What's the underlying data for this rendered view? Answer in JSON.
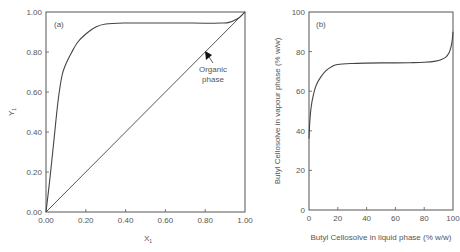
{
  "chart_data": [
    {
      "type": "line",
      "panel_label": "(a)",
      "title": "",
      "xlabel": "X",
      "xlabel_sub": "1",
      "ylabel": "Y",
      "ylabel_sub": "1",
      "xlim": [
        0,
        1
      ],
      "ylim": [
        0,
        1
      ],
      "xticks": [
        "0.00",
        "0.20",
        "0.40",
        "0.60",
        "0.80",
        "1.00"
      ],
      "yticks": [
        "0.00",
        "0.20",
        "0.40",
        "0.60",
        "0.80",
        "1.00"
      ],
      "grid": false,
      "series": [
        {
          "name": "equilibrium curve",
          "x": [
            0.0,
            0.02,
            0.04,
            0.06,
            0.08,
            0.1,
            0.13,
            0.16,
            0.2,
            0.25,
            0.3,
            0.4,
            0.5,
            0.6,
            0.7,
            0.8,
            0.88,
            0.92,
            0.96,
            0.98,
            1.0
          ],
          "y": [
            0.0,
            0.17,
            0.36,
            0.55,
            0.68,
            0.74,
            0.8,
            0.85,
            0.89,
            0.925,
            0.94,
            0.945,
            0.945,
            0.945,
            0.945,
            0.944,
            0.945,
            0.948,
            0.965,
            0.98,
            1.0
          ]
        },
        {
          "name": "diagonal y=x",
          "x": [
            0,
            1
          ],
          "y": [
            0,
            1
          ]
        }
      ],
      "annotations": [
        {
          "text_line1": "Organic",
          "text_line2": "phase",
          "arrow_to": [
            0.8,
            0.8
          ]
        }
      ]
    },
    {
      "type": "line",
      "panel_label": "(b)",
      "title": "",
      "xlabel": "Butyl Cellosolve in liquid phase (% w/w)",
      "ylabel": "Butyl Cellosolve in vapour phase (% w/w)",
      "xlim": [
        0,
        100
      ],
      "ylim": [
        0,
        100
      ],
      "xticks": [
        "0",
        "20",
        "40",
        "60",
        "80",
        "100"
      ],
      "yticks": [
        "0",
        "20",
        "40",
        "60",
        "80",
        "100"
      ],
      "grid": false,
      "series": [
        {
          "name": "vapour-liquid equilibrium",
          "x": [
            0,
            0.5,
            1.5,
            3,
            5,
            8,
            12,
            16,
            20,
            30,
            40,
            50,
            60,
            70,
            80,
            88,
            92,
            95,
            97,
            98.5,
            99.5,
            100
          ],
          "y": [
            36,
            44,
            52,
            58,
            63,
            67,
            70.5,
            72.5,
            73.5,
            74,
            74.2,
            74.3,
            74.3,
            74.4,
            74.6,
            75.2,
            76,
            77.2,
            79,
            82,
            86,
            90
          ]
        }
      ],
      "annotations": []
    }
  ]
}
